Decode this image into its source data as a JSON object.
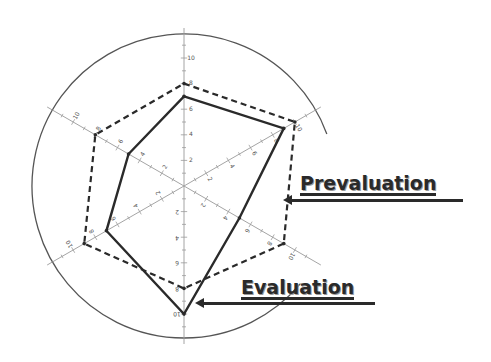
{
  "chart_data": {
    "type": "radar",
    "title": "",
    "axes": [
      "Axis 1 (top)",
      "Axis 2 (upper-right)",
      "Axis 3 (lower-right)",
      "Axis 4 (bottom)",
      "Axis 5 (lower-left)",
      "Axis 6 (upper-left)"
    ],
    "axis_angles_deg": [
      90,
      30,
      -30,
      -90,
      -150,
      150
    ],
    "range": [
      0,
      10
    ],
    "tick_labels": [
      "2",
      "4",
      "6",
      "8",
      "10"
    ],
    "minor_ticks_per_major": 2,
    "outer_circle": true,
    "series": [
      {
        "name": "Prevaluation",
        "style": "dashed",
        "color": "#2a2a2a",
        "values": [
          8,
          10,
          9,
          8,
          9,
          8
        ]
      },
      {
        "name": "Evaluation",
        "style": "solid",
        "color": "#2a2a2a",
        "values": [
          7,
          9,
          5,
          10,
          7,
          5
        ]
      }
    ],
    "legend": "callout-arrows-right"
  },
  "labels": {
    "prevaluation": "Prevaluation",
    "evaluation": "Evaluation"
  },
  "colors": {
    "line": "#2a2a2a",
    "axis": "#9a9a9a",
    "circle": "#555555",
    "background": "#ffffff"
  }
}
